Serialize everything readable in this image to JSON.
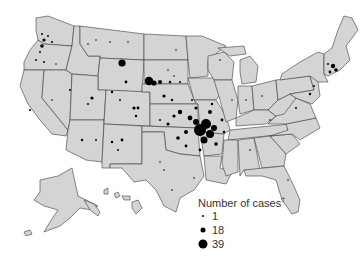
{
  "map": {
    "title": "Number of cases",
    "title_footnote_marker": "†",
    "region": "United States (contiguous, Alaska, Hawaii)",
    "fill_color": "#d4d4d4",
    "border_color": "#3a3a3a",
    "dot_color": "#000000",
    "legend": {
      "title": "Number of cases",
      "footnote_marker": "†",
      "items": [
        {
          "label": "1",
          "size_px": 2
        },
        {
          "label": "18",
          "size_px": 5
        },
        {
          "label": "39",
          "size_px": 9
        }
      ]
    },
    "notable_clusters": [
      {
        "area": "Oklahoma / Arkansas / Missouri (Ozarks)",
        "density": "very high"
      },
      {
        "area": "South Dakota / Nebraska",
        "density": "high, several large dots"
      },
      {
        "area": "Wyoming",
        "density": "one large dot"
      },
      {
        "area": "Massachusetts / Rhode Island",
        "density": "high"
      },
      {
        "area": "Washington / Oregon (western)",
        "density": "moderate"
      }
    ]
  }
}
